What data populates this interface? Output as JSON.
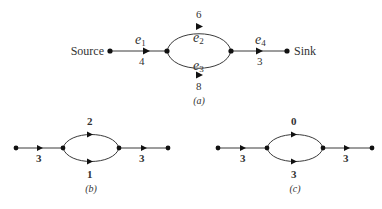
{
  "diagrams": [
    {
      "id": "a",
      "caption": "(a)",
      "source_label": "Source",
      "sink_label": "Sink",
      "edges": [
        {
          "name": "e",
          "sub": "1",
          "value": "4"
        },
        {
          "name": "e",
          "sub": "2",
          "value": "6"
        },
        {
          "name": "e",
          "sub": "3",
          "value": "8"
        },
        {
          "name": "e",
          "sub": "4",
          "value": "3"
        }
      ]
    },
    {
      "id": "b",
      "caption": "(b)",
      "edges": [
        {
          "value": "3"
        },
        {
          "value": "2"
        },
        {
          "value": "1"
        },
        {
          "value": "3"
        }
      ]
    },
    {
      "id": "c",
      "caption": "(c)",
      "edges": [
        {
          "value": "3"
        },
        {
          "value": "0"
        },
        {
          "value": "3"
        },
        {
          "value": "3"
        }
      ]
    }
  ],
  "colors": {
    "line": "#3a3a3a",
    "node": "#111111",
    "text": "#333333"
  }
}
